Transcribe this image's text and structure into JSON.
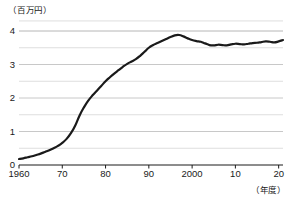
{
  "chart_data": {
    "type": "line",
    "title": "",
    "subtitle": "",
    "ylabel": "（百万円）",
    "xlabel": "（年度）",
    "ylim": [
      0,
      4.3
    ],
    "xlim": [
      1960,
      2021
    ],
    "yticks": [
      0,
      1,
      2,
      3,
      4
    ],
    "ytick_labels": [
      "0",
      "1",
      "2",
      "3",
      "4"
    ],
    "minor_yticks": [
      0.5,
      1.5,
      2.5,
      3.5,
      4.0
    ],
    "grid": "horizontal-major-and-minor",
    "legend": "none",
    "xticks": [
      1960,
      1970,
      1980,
      1990,
      2000,
      2010,
      2020
    ],
    "xtick_labels": [
      "1960",
      "70",
      "80",
      "90",
      "2000",
      "10",
      "20"
    ],
    "line_color": "#1a1a1a",
    "line_width_px": 2.2,
    "series": [
      {
        "name": "金額",
        "x": [
          1960,
          1961,
          1962,
          1963,
          1964,
          1965,
          1966,
          1967,
          1968,
          1969,
          1970,
          1971,
          1972,
          1973,
          1974,
          1975,
          1976,
          1977,
          1978,
          1979,
          1980,
          1981,
          1982,
          1983,
          1984,
          1985,
          1986,
          1987,
          1988,
          1989,
          1990,
          1991,
          1992,
          1993,
          1994,
          1995,
          1996,
          1997,
          1998,
          1999,
          2000,
          2001,
          2002,
          2003,
          2004,
          2005,
          2006,
          2007,
          2008,
          2009,
          2010,
          2011,
          2012,
          2013,
          2014,
          2015,
          2016,
          2017,
          2018,
          2019,
          2020,
          2021
        ],
        "values": [
          0.18,
          0.2,
          0.23,
          0.26,
          0.3,
          0.34,
          0.39,
          0.44,
          0.5,
          0.57,
          0.66,
          0.78,
          0.95,
          1.18,
          1.48,
          1.72,
          1.92,
          2.08,
          2.22,
          2.36,
          2.5,
          2.62,
          2.73,
          2.83,
          2.93,
          3.02,
          3.09,
          3.16,
          3.26,
          3.38,
          3.5,
          3.58,
          3.64,
          3.7,
          3.76,
          3.82,
          3.87,
          3.88,
          3.84,
          3.78,
          3.73,
          3.7,
          3.68,
          3.63,
          3.58,
          3.57,
          3.59,
          3.58,
          3.57,
          3.6,
          3.62,
          3.61,
          3.6,
          3.62,
          3.64,
          3.65,
          3.67,
          3.69,
          3.68,
          3.66,
          3.69,
          3.73
        ]
      }
    ]
  }
}
